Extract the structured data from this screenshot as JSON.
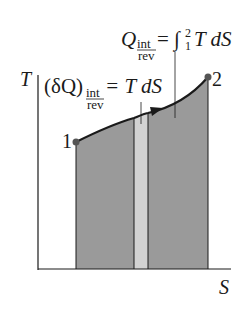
{
  "diagram": {
    "axes": {
      "y_label": "T",
      "x_label": "S"
    },
    "points": [
      {
        "label": "1",
        "x": 76,
        "y": 142
      },
      {
        "label": "2",
        "x": 208,
        "y": 77
      }
    ],
    "annotations": {
      "total_heat": {
        "main": "Q",
        "sub_top": "int",
        "sub_bottom": "rev",
        "eq": "= ∫",
        "upper": "2",
        "lower": "1",
        "rhs": "T dS"
      },
      "differential_heat": {
        "main": "(δQ)",
        "sub_top": "int",
        "sub_bottom": "rev",
        "rhs": "= T dS"
      }
    },
    "colors": {
      "area": "#9a9a9a",
      "strip": "#d2d2d2",
      "line": "#1a1a1a",
      "point": "#555555"
    }
  }
}
